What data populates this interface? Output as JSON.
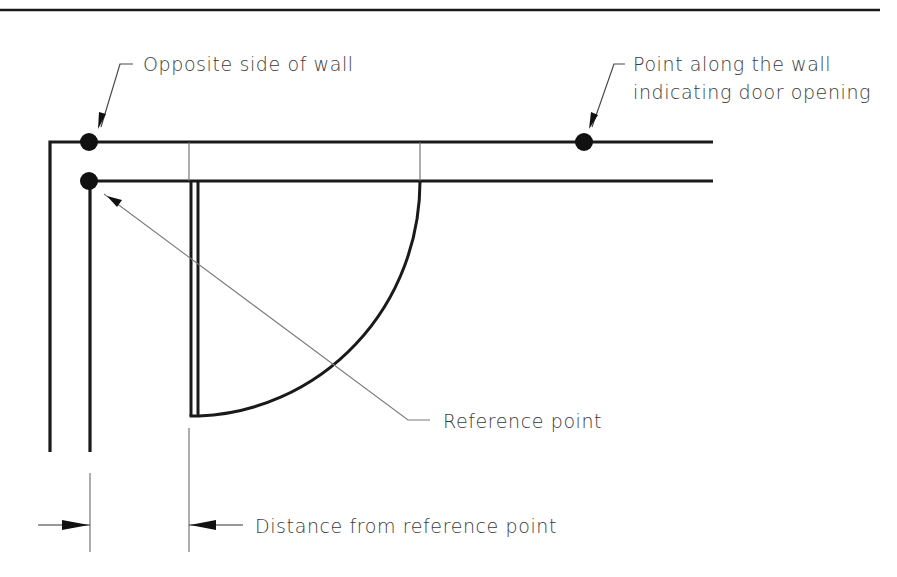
{
  "diagram": {
    "type": "architectural-plan-detail",
    "colors": {
      "line": "#1a1a1a",
      "thin_line": "#6a6a6a",
      "text": "#3a3a3a",
      "background": "#ffffff"
    },
    "callouts": {
      "opposite_side": {
        "label": "Opposite side of wall"
      },
      "door_point": {
        "line1": "Point along the wall",
        "line2": "indicating door opening"
      },
      "reference_point": {
        "label": "Reference point"
      },
      "distance": {
        "label": "Distance from reference point"
      }
    },
    "elements": [
      {
        "name": "title-rule",
        "kind": "horizontal line"
      },
      {
        "name": "outer-wall-line",
        "kind": "wall edge"
      },
      {
        "name": "inner-wall-line",
        "kind": "wall edge"
      },
      {
        "name": "door-leaf",
        "kind": "door panel"
      },
      {
        "name": "door-swing-arc",
        "kind": "quarter-circle swing"
      },
      {
        "name": "marker-dots",
        "count": 3
      },
      {
        "name": "dimension-line",
        "kind": "distance dimension with arrows"
      }
    ]
  }
}
